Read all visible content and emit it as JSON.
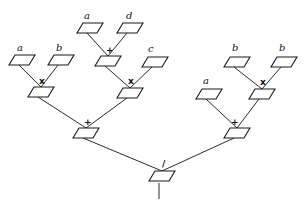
{
  "diagram": {
    "colors": {
      "line": "#2a2a2a",
      "node_fill": "#ffffff",
      "text": "#111111",
      "background": "#ffffff"
    },
    "nodes": [
      {
        "id": "leaf-a1",
        "type": "leaf",
        "label": "a",
        "x": 22,
        "y": 55,
        "lx": 17,
        "ly": 51
      },
      {
        "id": "leaf-b1",
        "type": "leaf",
        "label": "b",
        "x": 61,
        "y": 55,
        "lx": 56,
        "ly": 51
      },
      {
        "id": "leaf-a2",
        "type": "leaf",
        "label": "a",
        "x": 90,
        "y": 23,
        "lx": 84,
        "ly": 19
      },
      {
        "id": "leaf-d",
        "type": "leaf",
        "label": "d",
        "x": 130,
        "y": 23,
        "lx": 126,
        "ly": 19
      },
      {
        "id": "leaf-c",
        "type": "leaf",
        "label": "c",
        "x": 155,
        "y": 57,
        "lx": 148,
        "ly": 52
      },
      {
        "id": "leaf-a3",
        "type": "leaf",
        "label": "a",
        "x": 209,
        "y": 89,
        "lx": 203,
        "ly": 84
      },
      {
        "id": "leaf-b2",
        "type": "leaf",
        "label": "b",
        "x": 237,
        "y": 57,
        "lx": 232,
        "ly": 51
      },
      {
        "id": "leaf-b3",
        "type": "leaf",
        "label": "b",
        "x": 284,
        "y": 57,
        "lx": 279,
        "ly": 51
      },
      {
        "id": "op-mul1",
        "type": "op",
        "label": "x",
        "x": 41,
        "y": 87,
        "lx": 39,
        "ly": 84
      },
      {
        "id": "op-add1",
        "type": "op",
        "label": "+",
        "x": 108,
        "y": 56,
        "lx": 106,
        "ly": 53
      },
      {
        "id": "op-mul2",
        "type": "op",
        "label": "x",
        "x": 130,
        "y": 88,
        "lx": 128,
        "ly": 84
      },
      {
        "id": "op-add2",
        "type": "op",
        "label": "+",
        "x": 86,
        "y": 128,
        "lx": 84,
        "ly": 125
      },
      {
        "id": "op-mul3",
        "type": "op",
        "label": "x",
        "x": 262,
        "y": 89,
        "lx": 260,
        "ly": 85
      },
      {
        "id": "op-add3",
        "type": "op",
        "label": "+",
        "x": 237,
        "y": 128,
        "lx": 231,
        "ly": 125
      },
      {
        "id": "op-div",
        "type": "op",
        "label": "/",
        "x": 162,
        "y": 171,
        "lx": 162,
        "ly": 167
      }
    ],
    "edges": [
      [
        "leaf-a1",
        "op-mul1"
      ],
      [
        "leaf-b1",
        "op-mul1"
      ],
      [
        "leaf-a2",
        "op-add1"
      ],
      [
        "leaf-d",
        "op-add1"
      ],
      [
        "op-add1",
        "op-mul2"
      ],
      [
        "leaf-c",
        "op-mul2"
      ],
      [
        "op-mul1",
        "op-add2"
      ],
      [
        "op-mul2",
        "op-add2"
      ],
      [
        "leaf-b2",
        "op-mul3"
      ],
      [
        "leaf-b3",
        "op-mul3"
      ],
      [
        "leaf-a3",
        "op-add3"
      ],
      [
        "op-mul3",
        "op-add3"
      ],
      [
        "op-add2",
        "op-div"
      ],
      [
        "op-add3",
        "op-div"
      ]
    ],
    "root_stem": {
      "x": 162,
      "y1": 183,
      "y2": 199
    }
  }
}
